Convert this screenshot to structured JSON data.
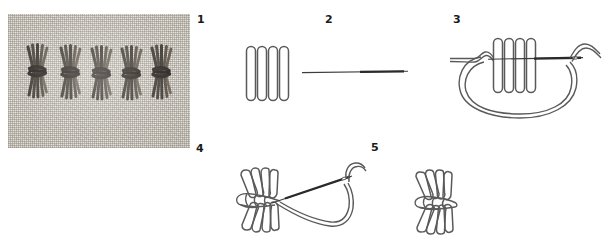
{
  "document": {
    "type": "embroidery-stitch-tutorial",
    "subject": "sheaf-stitch",
    "background_color": "#ffffff",
    "ink_color": "#4a4a4a",
    "label_color": "#1a1a1a",
    "thread_color_photo": "#3a332c",
    "fabric_color_photo": "#e7e4dd"
  },
  "steps": [
    {
      "number": "1",
      "name": "finished-row-photograph",
      "kind": "photo",
      "description": "Photograph of a row of five completed sheaf stitches worked in dark thread on pale woven linen fabric",
      "stitch_count": 5
    },
    {
      "number": "2",
      "name": "needle-under-bars-diagram",
      "kind": "line-drawing",
      "description": "Four vertical straight satin stitch bars with the needle passing horizontally beneath their centre",
      "bar_count": 4
    },
    {
      "number": "3",
      "name": "thread-wrapped-around-bars-diagram",
      "kind": "line-drawing",
      "description": "The working thread is carried around the group of four bars forming a large loop, needle emerging at the right",
      "bar_count": 4
    },
    {
      "number": "4",
      "name": "tightening-the-waist-diagram",
      "kind": "line-drawing",
      "description": "The wrapping thread is pulled tight drawing the four bars into a cinched waist, needle and loop shown at the right",
      "bar_count": 4
    },
    {
      "number": "5",
      "name": "completed-sheaf-stitch-diagram",
      "kind": "line-drawing",
      "description": "The completed sheaf stitch with the four bars splayed above and below the tied waist",
      "bar_count": 4
    }
  ],
  "labels": {
    "step1": "1",
    "step2": "2",
    "step3": "3",
    "step4": "4",
    "step5": "5"
  }
}
